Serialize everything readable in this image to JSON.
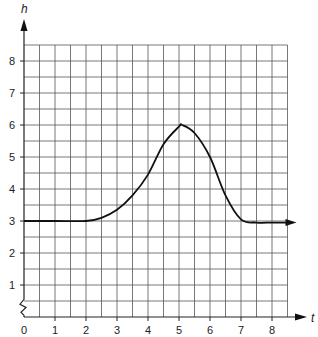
{
  "chart_data": {
    "type": "line",
    "title": "",
    "xlabel": "t",
    "ylabel": "h",
    "xlim": [
      0,
      8.5
    ],
    "ylim": [
      0,
      8.5
    ],
    "x_ticks": [
      "0",
      "1",
      "2",
      "3",
      "4",
      "5",
      "6",
      "7",
      "8"
    ],
    "y_ticks": [
      "1",
      "2",
      "3",
      "4",
      "5",
      "6",
      "7",
      "8"
    ],
    "grid": true,
    "grid_step": 0.5,
    "y_axis_break": true,
    "series": [
      {
        "name": "h(t)",
        "x": [
          0,
          1,
          2,
          2.5,
          3,
          3.5,
          4,
          4.5,
          5,
          5.1,
          5.5,
          6,
          6.5,
          7,
          7.5,
          8,
          8.5
        ],
        "values": [
          3,
          3,
          3,
          3.1,
          3.35,
          3.8,
          4.45,
          5.4,
          5.95,
          6.0,
          5.75,
          5.0,
          3.8,
          3.05,
          2.95,
          2.95,
          2.95
        ]
      }
    ],
    "legend": null
  }
}
